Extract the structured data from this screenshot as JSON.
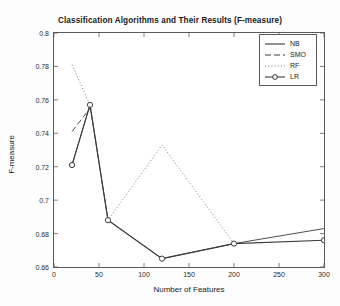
{
  "chart_data": {
    "type": "line",
    "title": "Classification Algorithms and Their Results (F-measure)",
    "xlabel": "Number of Features",
    "ylabel": "F-measure",
    "xlim": [
      0,
      300
    ],
    "ylim": [
      0.66,
      0.8
    ],
    "xticks": [
      0,
      50,
      100,
      150,
      200,
      250,
      300
    ],
    "yticks": [
      0.66,
      0.68,
      0.7,
      0.72,
      0.74,
      0.76,
      0.78,
      0.8
    ],
    "grid": false,
    "legend_position": "top-right",
    "series": [
      {
        "name": "NB",
        "style": "solid",
        "marker": "none",
        "color": "#3a3a3a",
        "x": [
          20,
          40,
          60,
          120,
          200,
          300
        ],
        "y": [
          0.721,
          0.757,
          0.688,
          0.665,
          0.674,
          0.683
        ]
      },
      {
        "name": "SMO",
        "style": "dashed",
        "marker": "none",
        "color": "#3a3a3a",
        "x": [
          20,
          40
        ],
        "y": [
          0.741,
          0.755
        ]
      },
      {
        "name": "RF",
        "style": "dotted",
        "marker": "none",
        "color": "#6f6f6f",
        "x": [
          20,
          40,
          60,
          120,
          200
        ],
        "y": [
          0.781,
          0.757,
          0.688,
          0.733,
          0.674
        ]
      },
      {
        "name": "LR",
        "style": "solid",
        "marker": "circle",
        "color": "#3a3a3a",
        "x": [
          20,
          40,
          60,
          120,
          200,
          300
        ],
        "y": [
          0.721,
          0.757,
          0.688,
          0.665,
          0.674,
          0.676
        ]
      }
    ]
  },
  "legend": {
    "items": [
      {
        "label": "NB"
      },
      {
        "label": "SMO"
      },
      {
        "label": "RF"
      },
      {
        "label": "LR"
      }
    ]
  },
  "axis_labels": {
    "x": "Number of Features",
    "y": "F-measure"
  },
  "title": "Classification Algorithms and Their Results (F-measure)"
}
